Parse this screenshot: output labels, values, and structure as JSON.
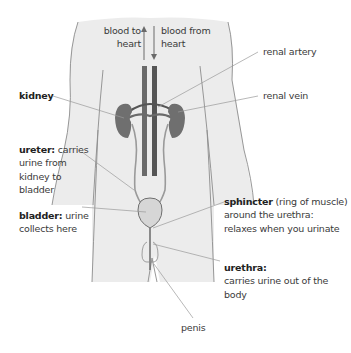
{
  "diagram": {
    "colors": {
      "body_fill": "#ececec",
      "outline": "#8c8c8c",
      "organ": "#6f6f6f",
      "vessel": "#6a6a6a",
      "bladder_fill": "#d6d6d6",
      "leader": "#9a9a9a",
      "text": "#3a3a3a"
    },
    "labels": {
      "blood_to_heart": {
        "line1": "blood to",
        "line2": "heart"
      },
      "blood_from_heart": {
        "line1": "blood from",
        "line2": "heart"
      },
      "renal_artery": "renal artery",
      "renal_vein": "renal vein",
      "kidney": "kidney",
      "ureter": {
        "term": "ureter:",
        "line1": " carries",
        "line2": "urine from",
        "line3": "kidney to",
        "line4": "bladder"
      },
      "bladder": {
        "term": "bladder:",
        "line1": " urine",
        "line2": "collects here"
      },
      "sphincter": {
        "term": "sphincter",
        "line1": " (ring of muscle)",
        "line2": "around the urethra:",
        "line3": "relaxes when you urinate"
      },
      "urethra": {
        "term": "urethra:",
        "line1": "carries urine out of the",
        "line2": "body"
      },
      "penis": "penis"
    }
  }
}
